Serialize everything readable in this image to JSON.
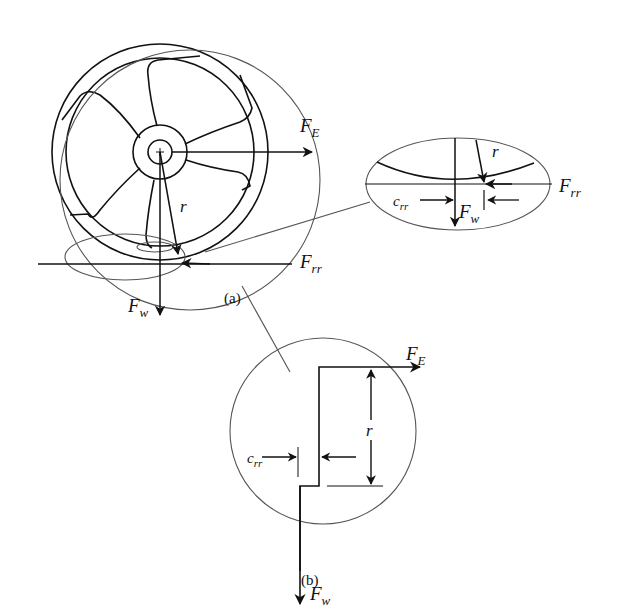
{
  "diagram": {
    "panel_a": {
      "caption": "(a)",
      "labels": {
        "fe": {
          "main": "F",
          "sub": "E"
        },
        "frr": {
          "main": "F",
          "sub": "rr"
        },
        "fw": {
          "main": "F",
          "sub": "w"
        },
        "r": "r"
      },
      "inset": {
        "labels": {
          "r": "r",
          "frr": {
            "main": "F",
            "sub": "rr"
          },
          "fw": {
            "main": "F",
            "sub": "w"
          },
          "crr": {
            "main": "c",
            "sub": "rr"
          }
        }
      }
    },
    "panel_b": {
      "caption": "(b)",
      "labels": {
        "fe": {
          "main": "F",
          "sub": "E"
        },
        "fw": {
          "main": "F",
          "sub": "w"
        },
        "r": "r",
        "crr": {
          "main": "c",
          "sub": "rr"
        }
      }
    },
    "colors": {
      "stroke": "#111111",
      "thin": "#555555",
      "background": "#ffffff"
    }
  }
}
